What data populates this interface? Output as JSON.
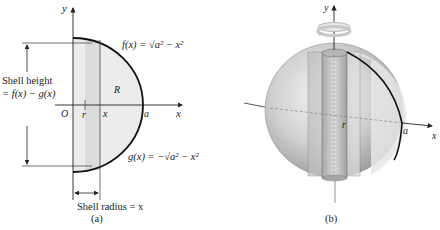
{
  "panel_a": {
    "caption": "(a)",
    "axis_x_label": "x",
    "axis_y_label": "y",
    "origin_label": "O",
    "tick_r_label": "r",
    "tick_x_label": "x",
    "tick_a_label": "a",
    "region_label": "R",
    "f_label": "f(x) = √a² − x²",
    "g_label": "g(x) = −√a² − x²",
    "shell_height_line1": "Shell height",
    "shell_height_line2": "= f(x) − g(x)",
    "shell_radius_label": "Shell radius = x"
  },
  "panel_b": {
    "caption": "(b)",
    "axis_y_label": "y",
    "axis_x_label": "x",
    "r_label": "r",
    "a_label": "a"
  },
  "colors": {
    "region_fill": "#ececec",
    "strip_fill": "#dcdcdc",
    "sphere_base": "#c8c8c8",
    "curve": "#111111"
  }
}
